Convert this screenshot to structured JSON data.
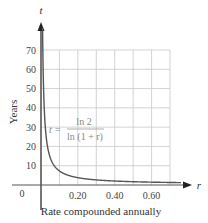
{
  "chart_data": {
    "type": "line",
    "title": "",
    "xlabel": "Rate compounded annually",
    "ylabel": "Years",
    "x_axis_var": "r",
    "y_axis_var": "t",
    "xlim": [
      0,
      0.7
    ],
    "ylim": [
      0,
      70
    ],
    "x_ticks": [
      "0.20",
      "0.40",
      "0.60"
    ],
    "x_tick_values": [
      0.2,
      0.4,
      0.6
    ],
    "y_ticks": [
      "10",
      "20",
      "30",
      "40",
      "50",
      "60",
      "70"
    ],
    "y_tick_values": [
      10,
      20,
      30,
      40,
      50,
      60,
      70
    ],
    "origin_label": "0",
    "grid": true,
    "grid_x_step": 0.1,
    "grid_y_step": 10,
    "annotation": {
      "lhs": "t =",
      "numerator": "ln 2",
      "denominator": "ln (1 + r)"
    },
    "series": [
      {
        "name": "t = ln 2 / ln(1 + r)",
        "x": [
          0.01,
          0.02,
          0.03,
          0.05,
          0.08,
          0.1,
          0.15,
          0.2,
          0.3,
          0.4,
          0.5,
          0.6,
          0.7
        ],
        "values": [
          69.7,
          35.0,
          23.4,
          14.2,
          9.0,
          7.3,
          5.0,
          3.8,
          2.6,
          2.1,
          1.7,
          1.5,
          1.3
        ]
      }
    ]
  },
  "colors": {
    "curve": "#555555",
    "grid": "#c8c8c8",
    "axis": "#555555",
    "formula": "#888888"
  }
}
